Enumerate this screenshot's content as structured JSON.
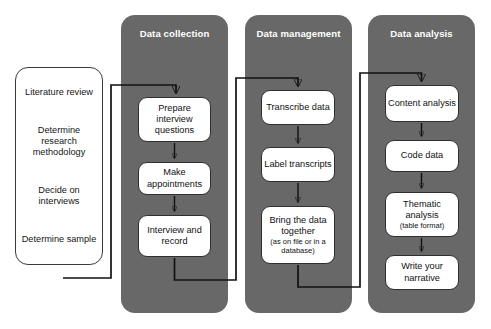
{
  "diagram": {
    "colors": {
      "phase_background": "#686868",
      "phase_title_text": "#ffffff",
      "step_background": "#ffffff",
      "step_border": "#2f2f2f",
      "connector": "#111111",
      "page_background": "#ffffff"
    }
  },
  "preparation": {
    "items": [
      "Literature review",
      "Determine research methodology",
      "Decide on interviews",
      "Determine sample"
    ]
  },
  "phases": [
    {
      "id": "data-collection",
      "title": "Data collection",
      "steps": [
        {
          "label": "Prepare interview questions",
          "sub": ""
        },
        {
          "label": "Make appointments",
          "sub": ""
        },
        {
          "label": "Interview and record",
          "sub": ""
        }
      ]
    },
    {
      "id": "data-management",
      "title": "Data management",
      "steps": [
        {
          "label": "Transcribe data",
          "sub": ""
        },
        {
          "label": "Label transcripts",
          "sub": ""
        },
        {
          "label": "Bring the data together",
          "sub": "(as on file or in a database)"
        }
      ]
    },
    {
      "id": "data-analysis",
      "title": "Data analysis",
      "steps": [
        {
          "label": "Content analysis",
          "sub": ""
        },
        {
          "label": "Code data",
          "sub": ""
        },
        {
          "label": "Thematic analysis",
          "sub": "(table format)"
        },
        {
          "label": "Write your narrative",
          "sub": ""
        }
      ]
    }
  ],
  "connectors": [
    {
      "name": "preparation-to-data-collection"
    },
    {
      "name": "prepare-to-appointments"
    },
    {
      "name": "appointments-to-interview"
    },
    {
      "name": "data-collection-to-data-management"
    },
    {
      "name": "transcribe-to-label"
    },
    {
      "name": "label-to-bring"
    },
    {
      "name": "data-management-to-data-analysis"
    },
    {
      "name": "content-to-code"
    },
    {
      "name": "code-to-thematic"
    },
    {
      "name": "thematic-to-write"
    }
  ]
}
